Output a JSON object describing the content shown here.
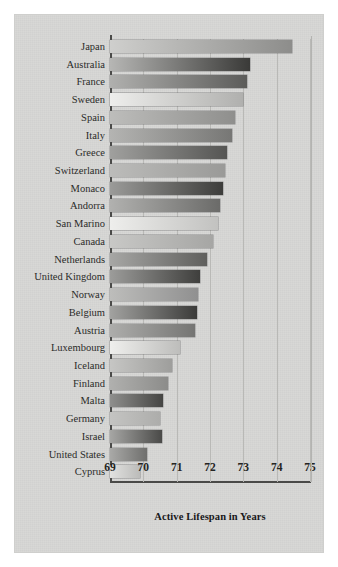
{
  "figure": {
    "background_color": "#d6d6d4",
    "axis_color": "#4a4a48",
    "grid_color": "#b9b9b6"
  },
  "chart_data": {
    "type": "bar",
    "orientation": "horizontal",
    "title": "",
    "xlabel": "Active Lifespan in Years",
    "ylabel": "",
    "xlim": [
      69,
      75
    ],
    "xticks": [
      69,
      70,
      71,
      72,
      73,
      74,
      75
    ],
    "xtick_labels": [
      "69",
      "70",
      "71",
      "72",
      "73",
      "74",
      "75"
    ],
    "grid": true,
    "grid_axis": "x",
    "legend": false,
    "categories": [
      "Japan",
      "Australia",
      "France",
      "Sweden",
      "Spain",
      "Italy",
      "Greece",
      "Switzerland",
      "Monaco",
      "Andorra",
      "San Marino",
      "Canada",
      "Netherlands",
      "United Kingdom",
      "Norway",
      "Belgium",
      "Austria",
      "Luxembourg",
      "Iceland",
      "Finland",
      "Malta",
      "Germany",
      "Israel",
      "United States",
      "Cyprus"
    ],
    "values": [
      74.45,
      73.2,
      73.1,
      73.0,
      72.75,
      72.65,
      72.5,
      72.45,
      72.4,
      72.3,
      72.25,
      72.1,
      71.9,
      71.7,
      71.65,
      71.6,
      71.55,
      71.1,
      70.85,
      70.75,
      70.6,
      70.5,
      70.55,
      70.1,
      69.9
    ],
    "bar_gradients": [
      [
        "#cfcfcd",
        "#8d8d8b"
      ],
      [
        "#b6b6b4",
        "#3a3a38"
      ],
      [
        "#b0b0ae",
        "#5c5c5a"
      ],
      [
        "#eeeeec",
        "#b0b0ae"
      ],
      [
        "#bdbdbb",
        "#8f8f8d"
      ],
      [
        "#b4b4b2",
        "#777775"
      ],
      [
        "#a0a09e",
        "#555553"
      ],
      [
        "#bcbcba",
        "#9a9a98"
      ],
      [
        "#9b9b99",
        "#3d3d3b"
      ],
      [
        "#b1b1af",
        "#6b6b69"
      ],
      [
        "#eeeeec",
        "#c2c2c0"
      ],
      [
        "#c8c8c6",
        "#a6a6a4"
      ],
      [
        "#a7a7a5",
        "#5f5f5d"
      ],
      [
        "#9c9c9a",
        "#3f3f3d"
      ],
      [
        "#bdbdbb",
        "#909090"
      ],
      [
        "#a2a2a0",
        "#3b3b39"
      ],
      [
        "#adadab",
        "#757573"
      ],
      [
        "#efefed",
        "#bdbdbb"
      ],
      [
        "#c6c6c4",
        "#9e9e9c"
      ],
      [
        "#b0b0ae",
        "#8c8c8a"
      ],
      [
        "#8f8f8d",
        "#454543"
      ],
      [
        "#c4c4c2",
        "#adadab"
      ],
      [
        "#a6a6a4",
        "#4a4a48"
      ],
      [
        "#a9a9a7",
        "#6f6f6d"
      ],
      [
        "#e2e2e0",
        "#bbbbb9"
      ]
    ]
  }
}
